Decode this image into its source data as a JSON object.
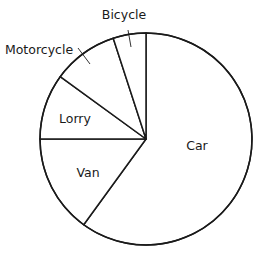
{
  "chart_data": {
    "type": "pie",
    "title": "",
    "start_angle": "top",
    "direction": "clockwise",
    "slices": [
      {
        "label": "Car",
        "value": 60,
        "label_placement": "inside"
      },
      {
        "label": "Van",
        "value": 15,
        "label_placement": "inside"
      },
      {
        "label": "Lorry",
        "value": 10,
        "label_placement": "inside"
      },
      {
        "label": "Motorcycle",
        "value": 10,
        "label_placement": "outside-leader"
      },
      {
        "label": "Bicycle",
        "value": 5,
        "label_placement": "outside-leader"
      }
    ],
    "slice_fill": "#ffffff",
    "stroke_color": "#1a1a1a",
    "legend": "none"
  }
}
